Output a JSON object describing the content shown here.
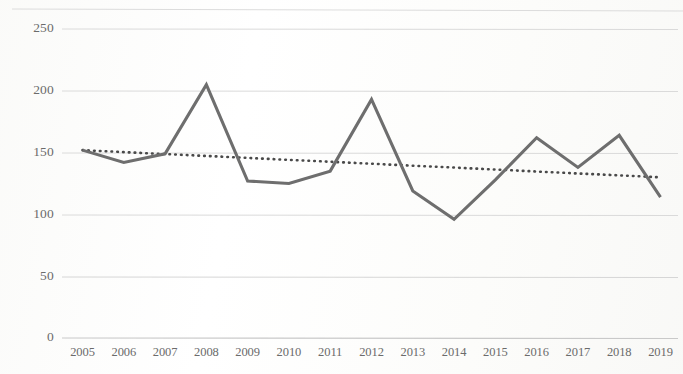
{
  "chart_data": {
    "type": "line",
    "title": "",
    "subtitle": "",
    "xlabel": "",
    "ylabel": "",
    "categories": [
      "2005",
      "2006",
      "2007",
      "2008",
      "2009",
      "2010",
      "2011",
      "2012",
      "2013",
      "2014",
      "2015",
      "2016",
      "2017",
      "2018",
      "2019"
    ],
    "series": [
      {
        "name": "value",
        "style": "solid",
        "color": "#6e6e6e",
        "values": [
          152,
          142,
          149,
          205,
          127,
          125,
          135,
          193,
          119,
          96,
          128,
          162,
          138,
          164,
          114
        ]
      },
      {
        "name": "trendline",
        "style": "dotted",
        "color": "#4a4a4a",
        "values": [
          152,
          150.4,
          148.8,
          147.3,
          145.7,
          144.1,
          142.6,
          141.0,
          139.4,
          137.9,
          136.3,
          134.7,
          133.1,
          131.6,
          130
        ]
      }
    ],
    "ylim": [
      0,
      250
    ],
    "yticks": [
      0,
      50,
      100,
      150,
      200,
      250
    ],
    "ytick_labels": [
      "0",
      "50",
      "100",
      "150",
      "200",
      "250"
    ],
    "xtick_labels": [
      "2005",
      "2006",
      "2007",
      "2008",
      "2009",
      "2010",
      "2011",
      "2012",
      "2013",
      "2014",
      "2015",
      "2016",
      "2017",
      "2018",
      "2019"
    ],
    "grid": true,
    "grid_axis": "y",
    "grid_color": "#d9d9d9",
    "legend": false,
    "legend_position": "none",
    "axis_color": "#cccccc",
    "background_color": "#ffffff"
  }
}
